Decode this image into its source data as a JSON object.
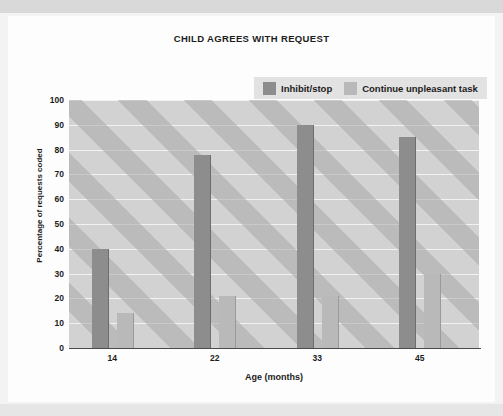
{
  "chart_data": {
    "type": "bar",
    "title": "CHILD AGREES WITH REQUEST",
    "xlabel": "Age (months)",
    "ylabel": "Percentage of requests coded",
    "categories": [
      "14",
      "22",
      "33",
      "45"
    ],
    "series": [
      {
        "name": "Inhibit/stop",
        "color": "#8d8d8d",
        "values": [
          40,
          78,
          90,
          85
        ]
      },
      {
        "name": "Continue unpleasant task",
        "color": "#b9b9b9",
        "values": [
          14,
          21,
          21,
          30
        ]
      }
    ],
    "ylim": [
      0,
      100
    ],
    "ytick_step": 10,
    "yticks": [
      0,
      10,
      20,
      30,
      40,
      50,
      60,
      70,
      80,
      90,
      100
    ],
    "grid": true,
    "legend_position": "top-right",
    "plot_background": "#d2d2d2"
  },
  "legend": {
    "items": [
      {
        "label": "Inhibit/stop",
        "color": "#8d8d8d"
      },
      {
        "label": "Continue unpleasant task",
        "color": "#b9b9b9"
      }
    ]
  }
}
